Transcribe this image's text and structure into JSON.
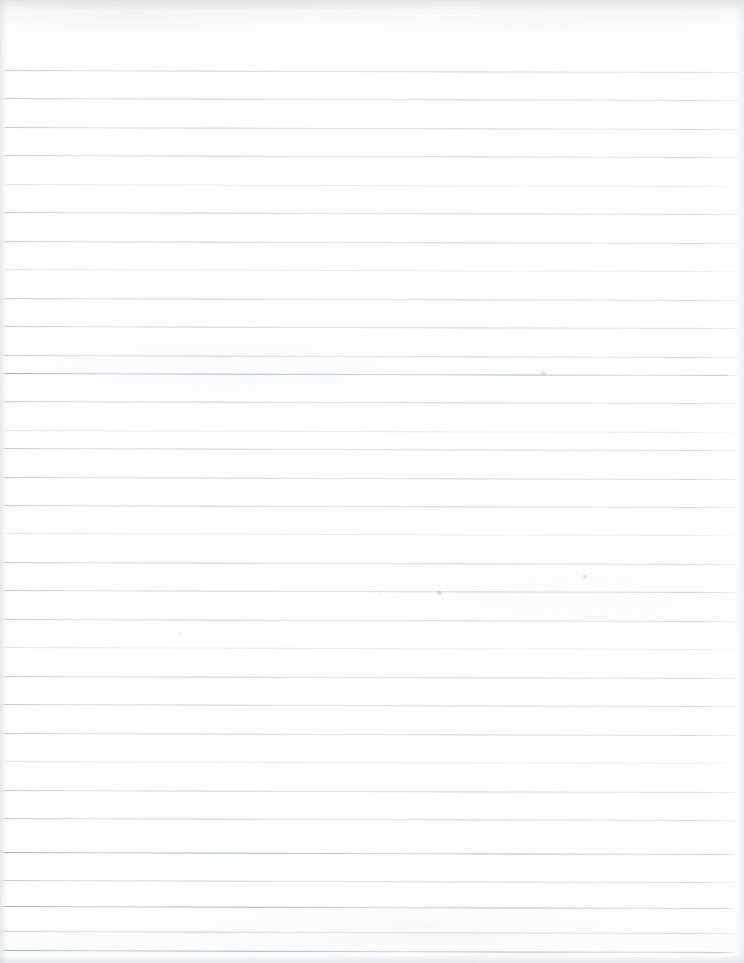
{
  "document": {
    "kind": "scanned-ruled-notebook-page",
    "title": "Blank lined notebook paper",
    "orientation": "portrait",
    "page_width_px": 744,
    "page_height_px": 963,
    "paper_color": "#fefefe",
    "rule_color": "#9aa2b4",
    "has_margin_rule": false,
    "has_handwriting": false,
    "visible_text": ""
  },
  "ruling": {
    "style": "wide-ruled",
    "first_line_y": 70,
    "line_spacing_px": 28.5,
    "line_count": 32,
    "line_thickness_px": 1,
    "line_start_x": 2,
    "line_end_x": 738,
    "skew_degrees": 0.16,
    "lines": [
      {
        "index": 1,
        "y": 70,
        "weight": "normal"
      },
      {
        "index": 2,
        "y": 98,
        "weight": "normal"
      },
      {
        "index": 3,
        "y": 127,
        "weight": "normal"
      },
      {
        "index": 4,
        "y": 155,
        "weight": "normal"
      },
      {
        "index": 5,
        "y": 184,
        "weight": "faint"
      },
      {
        "index": 6,
        "y": 212,
        "weight": "normal"
      },
      {
        "index": 7,
        "y": 241,
        "weight": "normal"
      },
      {
        "index": 8,
        "y": 269,
        "weight": "faint"
      },
      {
        "index": 9,
        "y": 298,
        "weight": "normal"
      },
      {
        "index": 10,
        "y": 326,
        "weight": "normal"
      },
      {
        "index": 11,
        "y": 355,
        "weight": "normal"
      },
      {
        "index": 12,
        "y": 373,
        "weight": "strong"
      },
      {
        "index": 13,
        "y": 401,
        "weight": "normal"
      },
      {
        "index": 14,
        "y": 430,
        "weight": "faint"
      },
      {
        "index": 15,
        "y": 448,
        "weight": "normal"
      },
      {
        "index": 16,
        "y": 477,
        "weight": "normal"
      },
      {
        "index": 17,
        "y": 505,
        "weight": "normal"
      },
      {
        "index": 18,
        "y": 533,
        "weight": "faint"
      },
      {
        "index": 19,
        "y": 562,
        "weight": "normal"
      },
      {
        "index": 20,
        "y": 590,
        "weight": "normal"
      },
      {
        "index": 21,
        "y": 619,
        "weight": "normal"
      },
      {
        "index": 22,
        "y": 647,
        "weight": "faint"
      },
      {
        "index": 23,
        "y": 676,
        "weight": "normal"
      },
      {
        "index": 24,
        "y": 704,
        "weight": "normal"
      },
      {
        "index": 25,
        "y": 733,
        "weight": "normal"
      },
      {
        "index": 26,
        "y": 761,
        "weight": "faint"
      },
      {
        "index": 27,
        "y": 790,
        "weight": "normal"
      },
      {
        "index": 28,
        "y": 818,
        "weight": "normal"
      },
      {
        "index": 29,
        "y": 852,
        "weight": "strong"
      },
      {
        "index": 30,
        "y": 880,
        "weight": "normal"
      },
      {
        "index": 31,
        "y": 906,
        "weight": "strong"
      },
      {
        "index": 32,
        "y": 931,
        "weight": "normal"
      },
      {
        "index": 33,
        "y": 950,
        "weight": "strong"
      }
    ]
  },
  "scan_artifacts": {
    "top_shadow": true,
    "left_edge_shadow": true,
    "right_edge_shadow": true,
    "bottom_edge_shadow": true,
    "marks": [
      {
        "name": "pencil-speck",
        "x": 178,
        "y": 633,
        "size": 3
      },
      {
        "name": "faint-smudge",
        "x": 437,
        "y": 591,
        "size": 5
      },
      {
        "name": "faint-smudge",
        "x": 583,
        "y": 575,
        "size": 4
      },
      {
        "name": "faint-smudge",
        "x": 540,
        "y": 371,
        "size": 6
      }
    ]
  }
}
